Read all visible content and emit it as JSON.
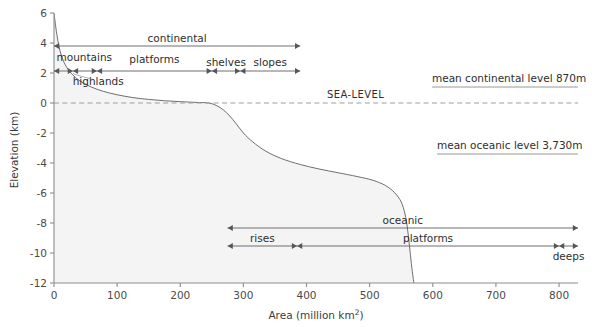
{
  "chart_data": {
    "type": "area",
    "title": "",
    "xlabel": "Area (million km2)",
    "xlabel_base": "Area (million km",
    "xlabel_sup": "2",
    "xlabel_tail": ")",
    "ylabel": "Elevation (km)",
    "xlim": [
      0,
      830
    ],
    "ylim": [
      -12,
      6
    ],
    "xticks": [
      0,
      100,
      200,
      300,
      400,
      500,
      600,
      700,
      800
    ],
    "xticklabels": [
      "0",
      "100",
      "200",
      "300",
      "400",
      "500",
      "600",
      "700",
      "800"
    ],
    "yticks": [
      6,
      4,
      2,
      0,
      -2,
      -4,
      -6,
      -8,
      -10,
      -12
    ],
    "yticklabels": [
      "6",
      "4",
      "2",
      "0",
      "-2",
      "-4",
      "-6",
      "-8",
      "-10",
      "-12"
    ],
    "grid": false,
    "legend": "none",
    "series": [
      {
        "name": "hypsographic curve",
        "x": [
          0,
          3,
          6,
          10,
          16,
          24,
          34,
          46,
          60,
          78,
          100,
          125,
          150,
          175,
          200,
          225,
          245,
          258,
          268,
          278,
          288,
          300,
          315,
          335,
          360,
          390,
          420,
          450,
          480,
          505,
          525,
          540,
          550,
          556,
          560,
          563,
          566,
          570
        ],
        "y": [
          6.0,
          5.0,
          4.2,
          3.4,
          2.7,
          2.15,
          1.7,
          1.35,
          1.05,
          0.78,
          0.55,
          0.36,
          0.24,
          0.15,
          0.09,
          0.04,
          0.0,
          -0.18,
          -0.45,
          -0.85,
          -1.35,
          -2.0,
          -2.6,
          -3.2,
          -3.7,
          -4.1,
          -4.4,
          -4.65,
          -4.9,
          -5.15,
          -5.5,
          -6.0,
          -6.6,
          -7.4,
          -8.4,
          -9.5,
          -10.7,
          -12.0
        ]
      }
    ],
    "sea_level": {
      "value": 0,
      "label": "SEA-LEVEL"
    },
    "reference_labels": [
      {
        "name": "mean-continental-level",
        "text": "mean continental level 870m",
        "elevation_m": 870
      },
      {
        "name": "mean-oceanic-level",
        "text": "mean oceanic level 3,730m",
        "elevation_m": -3730
      }
    ],
    "annotations_upper": [
      {
        "name": "continental",
        "label": "continental",
        "x_start": 0,
        "x_end": 390,
        "row": 0,
        "arrow": "both"
      },
      {
        "name": "mountains",
        "label": "mountains",
        "x_start": 0,
        "x_end": 30,
        "row": 1,
        "arrow": "both"
      },
      {
        "name": "highlands",
        "label": "highlands",
        "x_start": 30,
        "x_end": 68,
        "row": 1,
        "arrow": "both"
      },
      {
        "name": "platforms",
        "label": "platforms",
        "x_start": 68,
        "x_end": 250,
        "row": 1,
        "arrow": "both"
      },
      {
        "name": "shelves",
        "label": "shelves",
        "x_start": 250,
        "x_end": 295,
        "row": 1,
        "arrow": "both"
      },
      {
        "name": "slopes",
        "label": "slopes",
        "x_start": 295,
        "x_end": 390,
        "row": 1,
        "arrow": "both"
      }
    ],
    "annotations_lower": [
      {
        "name": "oceanic",
        "label": "oceanic",
        "x_start": 275,
        "x_end": 830,
        "row": 0,
        "arrow": "both"
      },
      {
        "name": "rises",
        "label": "rises",
        "x_start": 275,
        "x_end": 385,
        "row": 1,
        "arrow": "both"
      },
      {
        "name": "platforms-oceanic",
        "label": "platforms",
        "x_start": 385,
        "x_end": 800,
        "row": 1,
        "arrow": "both"
      },
      {
        "name": "deeps",
        "label": "deeps",
        "x_start": 800,
        "x_end": 830,
        "row": 1,
        "arrow": "both"
      }
    ]
  }
}
